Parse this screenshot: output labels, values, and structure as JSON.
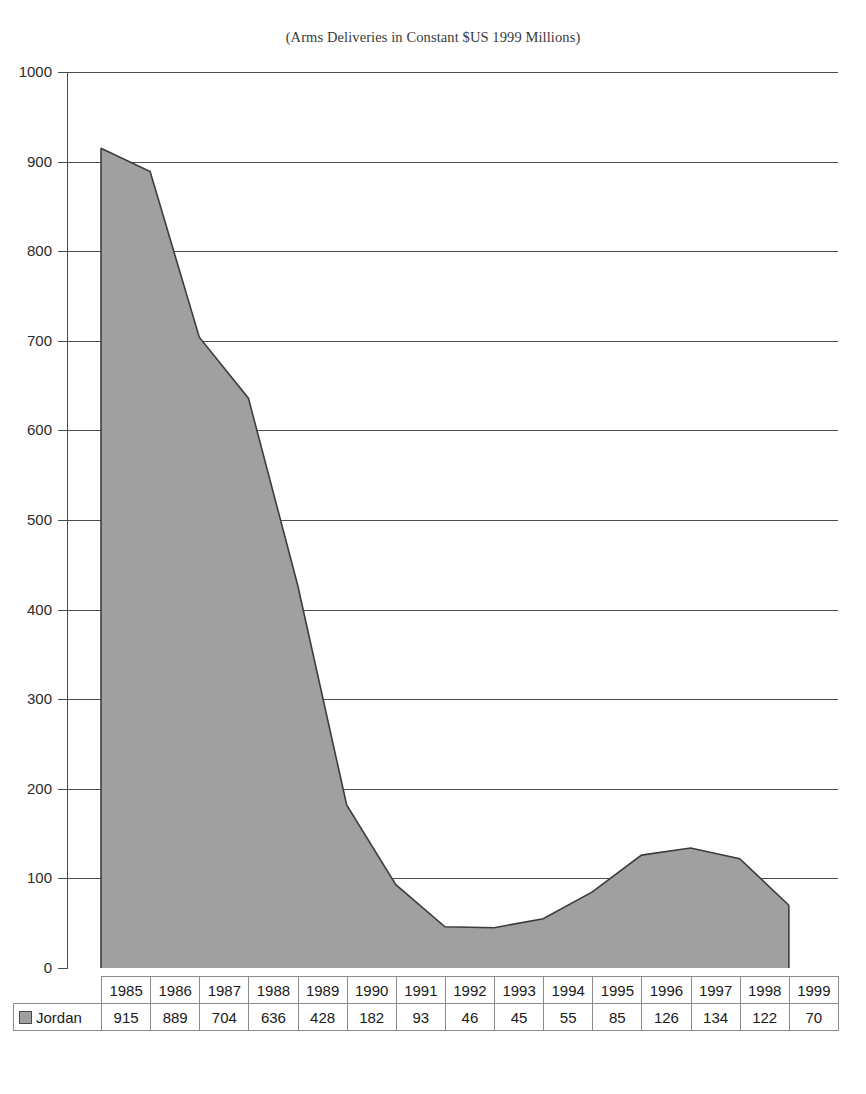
{
  "chart_title": "(Arms Deliveries in Constant $US 1999 Millions)",
  "legend": {
    "series_name": "Jordan",
    "swatch_icon": "legend-swatch-icon",
    "swatch_color": "#a0a0a0"
  },
  "axis": {
    "y_ticks": [
      "1000",
      "900",
      "800",
      "700",
      "600",
      "500",
      "400",
      "300",
      "200",
      "100",
      "0"
    ]
  },
  "chart_data": {
    "type": "area",
    "title": "(Arms Deliveries in Constant $US 1999 Millions)",
    "xlabel": "",
    "ylabel": "",
    "ylim": [
      0,
      1000
    ],
    "ytick_step": 100,
    "grid": true,
    "legend_position": "table-row-left",
    "categories": [
      "1985",
      "1986",
      "1987",
      "1988",
      "1989",
      "1990",
      "1991",
      "1992",
      "1993",
      "1994",
      "1995",
      "1996",
      "1997",
      "1998",
      "1999"
    ],
    "series": [
      {
        "name": "Jordan",
        "values": [
          915,
          889,
          704,
          636,
          428,
          182,
          93,
          46,
          45,
          55,
          85,
          126,
          134,
          122,
          70
        ],
        "fill_color": "#a0a0a0",
        "line_color": "#3c3c3c"
      }
    ]
  },
  "table": {
    "row_label": "Jordan",
    "headers": [
      "1985",
      "1986",
      "1987",
      "1988",
      "1989",
      "1990",
      "1991",
      "1992",
      "1993",
      "1994",
      "1995",
      "1996",
      "1997",
      "1998",
      "1999"
    ],
    "values": [
      "915",
      "889",
      "704",
      "636",
      "428",
      "182",
      "93",
      "46",
      "45",
      "55",
      "85",
      "126",
      "134",
      "122",
      "70"
    ]
  }
}
